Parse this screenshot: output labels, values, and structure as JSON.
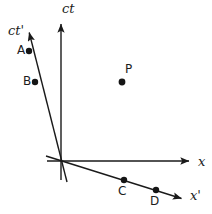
{
  "figure": {
    "width": 212,
    "height": 214,
    "background": "#ffffff",
    "line_color": "#1a1a1a",
    "dot_color": "#151515"
  },
  "axes": {
    "ct": {
      "label": "ct",
      "description": "vertical time axis of unprimed frame",
      "from": [
        61,
        180
      ],
      "to": [
        61,
        19
      ],
      "arrow": true
    },
    "x": {
      "label": "x",
      "description": "horizontal space axis of unprimed frame",
      "from": [
        47,
        161
      ],
      "to": [
        194,
        161
      ],
      "arrow": true
    },
    "ct_prime": {
      "label": "ct'",
      "description": "time axis of primed frame, tilted up and to the left",
      "from": [
        67,
        182
      ],
      "to": [
        28,
        27
      ],
      "arrow": true
    },
    "x_prime": {
      "label": "x'",
      "description": "space axis of primed frame, tilted down and to the right",
      "from": [
        46,
        156
      ],
      "to": [
        186,
        200
      ],
      "arrow": true
    }
  },
  "origin": {
    "x": 60,
    "y": 161
  },
  "events": [
    {
      "id": "A",
      "label": "A",
      "x": 29,
      "y": 51,
      "on_axis": "ct_prime"
    },
    {
      "id": "B",
      "label": "B",
      "x": 35,
      "y": 82,
      "on_axis": "ct_prime"
    },
    {
      "id": "C",
      "label": "C",
      "x": 124,
      "y": 180,
      "on_axis": "x_prime"
    },
    {
      "id": "D",
      "label": "D",
      "x": 156,
      "y": 190,
      "on_axis": "x_prime"
    },
    {
      "id": "P",
      "label": "P",
      "x": 122,
      "y": 82,
      "on_axis": "none"
    }
  ]
}
